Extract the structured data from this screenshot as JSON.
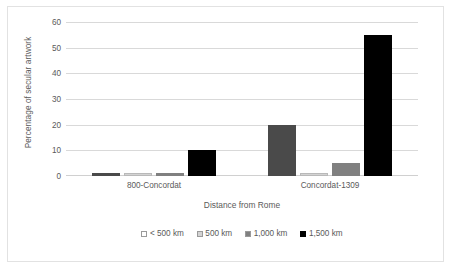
{
  "chart_data": {
    "type": "bar",
    "title": "",
    "xlabel": "Distance from Rome",
    "ylabel": "Percentage of secular artwork",
    "categories": [
      "800-Concordat",
      "Concordat-1309"
    ],
    "series": [
      {
        "name": "< 500 km",
        "color": "#4a4a4a",
        "values": [
          1,
          20
        ]
      },
      {
        "name": "500 km",
        "color": "#d3d3d3",
        "values": [
          1,
          1
        ]
      },
      {
        "name": "1,000 km",
        "color": "#808080",
        "values": [
          1,
          5
        ]
      },
      {
        "name": "1,500 km",
        "color": "#000000",
        "values": [
          10,
          55
        ]
      }
    ],
    "ylim": [
      0,
      60
    ],
    "yticks": [
      0,
      10,
      20,
      30,
      40,
      50,
      60
    ],
    "ytick_labels": [
      "0",
      "10",
      "20",
      "30",
      "40",
      "50",
      "60"
    ],
    "grid": true,
    "legend_position": "bottom",
    "gridline_color": "#d9d9d9",
    "text_color": "#5a5a5a",
    "border_color": "#e2e2e2",
    "background_color": "#ffffff"
  }
}
